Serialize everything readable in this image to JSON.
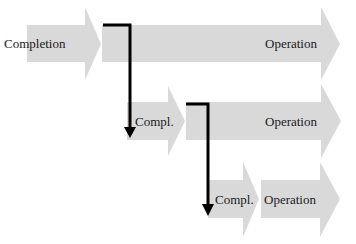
{
  "diagram": {
    "colors": {
      "arrow_fill": "#d9d9d9",
      "connector": "#000000",
      "text": "#1a1a1a"
    },
    "rows": [
      {
        "completion_label": "Completion",
        "operation_label": "Operation"
      },
      {
        "completion_label": "Compl.",
        "operation_label": "Operation"
      },
      {
        "completion_label": "Compl.",
        "operation_label": "Operation"
      }
    ]
  }
}
